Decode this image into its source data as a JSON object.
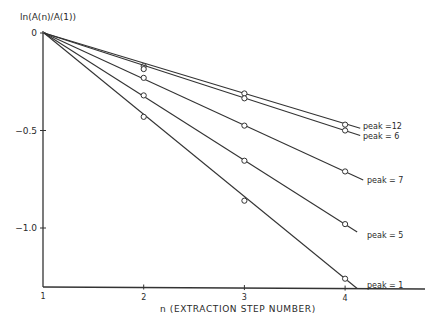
{
  "chart_data": {
    "type": "line",
    "title": "",
    "xlabel": "n (EXTRACTION STEP NUMBER)",
    "ylabel": "ln(A(n)/A(1))",
    "x": [
      1,
      2,
      3,
      4
    ],
    "xticks": [
      "1",
      "2",
      "3",
      "4"
    ],
    "yticks": [
      "0",
      "-0.5",
      "-1.0"
    ],
    "ytick_values": [
      0,
      -0.5,
      -1.0
    ],
    "xlim": [
      1,
      4.2
    ],
    "ylim": [
      -1.3,
      0
    ],
    "grid": false,
    "legend_position": "inline labels at right end of each line",
    "marker": "open circle",
    "series": [
      {
        "name": "peak = 12",
        "label": "peak =12",
        "values": [
          0,
          -0.17,
          -0.31,
          -0.47
        ],
        "fit_slope": -0.155
      },
      {
        "name": "peak = 6",
        "label": "peak = 6",
        "values": [
          0,
          -0.185,
          -0.335,
          -0.5
        ],
        "fit_slope": -0.167
      },
      {
        "name": "peak = 7",
        "label": "peak = 7",
        "values": [
          0,
          -0.23,
          -0.475,
          -0.71
        ],
        "fit_slope": -0.237
      },
      {
        "name": "peak = 5",
        "label": "peak = 5",
        "values": [
          0,
          -0.32,
          -0.655,
          -0.98
        ],
        "fit_slope": -0.327
      },
      {
        "name": "peak = 1",
        "label": "peak = 1",
        "values": [
          0,
          -0.43,
          -0.86,
          -1.26
        ],
        "fit_slope": -0.42
      }
    ]
  },
  "labels": {
    "ylabel": "ln(A(n)/A(1))",
    "xlabel": "n (EXTRACTION STEP NUMBER)"
  }
}
